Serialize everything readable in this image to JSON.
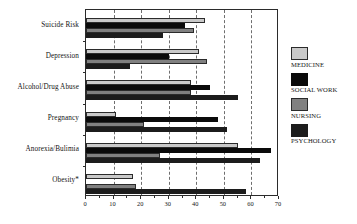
{
  "chart_data": {
    "type": "bar",
    "orientation": "horizontal",
    "title": "",
    "xlabel": "",
    "ylabel": "",
    "xlim": [
      0,
      70
    ],
    "xticks": [
      0,
      10,
      20,
      30,
      40,
      50,
      60,
      70
    ],
    "xtick_labels": [
      "0",
      "10",
      "20",
      "30",
      "40",
      "50",
      "60",
      "70"
    ],
    "minor_tick_step": 5,
    "grid": "vertical-dashed",
    "gridlines": [
      10,
      20,
      30,
      40,
      50,
      60
    ],
    "legend_position": "right",
    "categories": [
      "Suicide Risk",
      "Depression",
      "Alcohol/Drug Abuse",
      "Pregnancy",
      "Anorexia/Bulimia",
      "Obesity*"
    ],
    "series": [
      {
        "name": "MEDICINE",
        "color": "#c9c9c9",
        "values": [
          43,
          41,
          38,
          11,
          55,
          17
        ]
      },
      {
        "name": "SOCIAL WORK",
        "color": "#0a0a0a",
        "values": [
          36,
          30,
          45,
          48,
          67,
          0
        ]
      },
      {
        "name": "NURSING",
        "color": "#808080",
        "values": [
          39,
          44,
          38,
          21,
          27,
          18
        ]
      },
      {
        "name": "PSYCHOLOGY",
        "color": "#1c1c1c",
        "values": [
          28,
          16,
          55,
          51,
          63,
          58
        ]
      }
    ],
    "footnote": "*"
  },
  "legend": {
    "entries": [
      {
        "label": "MEDICINE",
        "swatch": "medicine"
      },
      {
        "label": "SOCIAL WORK",
        "swatch": "socialwork"
      },
      {
        "label": "NURSING",
        "swatch": "nursing"
      },
      {
        "label": "PSYCHOLOGY",
        "swatch": "psychology"
      }
    ]
  }
}
